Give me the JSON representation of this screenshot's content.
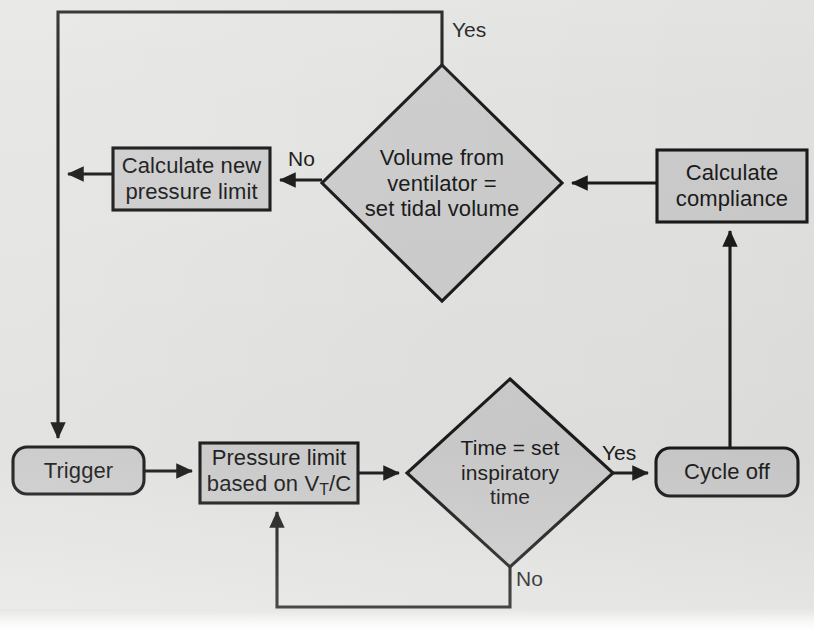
{
  "diagram": {
    "background_color": "#e6e6e4",
    "shape_fill_color": "#cfcfcf",
    "stroke_color": "#1b1b1b"
  },
  "nodes": [
    {
      "id": "trigger",
      "shape": "rounded-rectangle",
      "label": "Trigger",
      "font_size": 22,
      "x": 13,
      "y": 447,
      "w": 131,
      "h": 47,
      "rx": 14
    },
    {
      "id": "pressure-limit",
      "shape": "rectangle",
      "label": "Pressure limit\nbased on V<sub>T</sub>/C",
      "label_plain": "Pressure limit based on VT/C",
      "font_size": 22,
      "x": 200,
      "y": 443,
      "w": 158,
      "h": 60,
      "rx": 0
    },
    {
      "id": "time-check",
      "shape": "diamond",
      "label": "Time = set\ninspiratory\ntime",
      "font_size": 21,
      "cx": 510,
      "cy": 473,
      "w": 206,
      "h": 188
    },
    {
      "id": "cycle-off",
      "shape": "rounded-rectangle",
      "label": "Cycle off",
      "font_size": 22,
      "x": 656,
      "y": 448,
      "w": 142,
      "h": 48,
      "rx": 14
    },
    {
      "id": "calculate-compliance",
      "shape": "rectangle",
      "label": "Calculate\ncompliance",
      "font_size": 22,
      "x": 657,
      "y": 150,
      "w": 150,
      "h": 72,
      "rx": 0
    },
    {
      "id": "volume-check",
      "shape": "diamond",
      "label": "Volume from\nventilator =\nset tidal volume",
      "font_size": 22,
      "cx": 442,
      "cy": 183,
      "w": 240,
      "h": 237
    },
    {
      "id": "calculate-new-pressure-limit",
      "shape": "rectangle",
      "label": "Calculate new\npressure limit",
      "font_size": 22,
      "x": 113,
      "y": 148,
      "w": 157,
      "h": 62,
      "rx": 0
    }
  ],
  "edge_labels": [
    {
      "id": "yes-volume",
      "text": "Yes",
      "x": 452,
      "y": 19
    },
    {
      "id": "no-volume",
      "text": "No",
      "x": 288,
      "y": 148
    },
    {
      "id": "yes-time",
      "text": "Yes",
      "x": 602,
      "y": 442
    },
    {
      "id": "no-time",
      "text": "No",
      "x": 516,
      "y": 568
    }
  ],
  "edges": [
    {
      "id": "trigger-to-pressure-limit",
      "from": "trigger",
      "to": "pressure-limit",
      "label": ""
    },
    {
      "id": "pressure-limit-to-time-check",
      "from": "pressure-limit",
      "to": "time-check",
      "label": ""
    },
    {
      "id": "time-check-yes-to-cycle-off",
      "from": "time-check",
      "to": "cycle-off",
      "label": "Yes"
    },
    {
      "id": "time-check-no-to-pressure-limit",
      "from": "time-check",
      "to": "pressure-limit",
      "label": "No"
    },
    {
      "id": "cycle-off-to-calculate-compliance",
      "from": "cycle-off",
      "to": "calculate-compliance",
      "label": ""
    },
    {
      "id": "calculate-compliance-to-volume-check",
      "from": "calculate-compliance",
      "to": "volume-check",
      "label": ""
    },
    {
      "id": "volume-check-no-to-calculate-new-pressure-limit",
      "from": "volume-check",
      "to": "calculate-new-pressure-limit",
      "label": "No"
    },
    {
      "id": "calculate-new-pressure-limit-to-trigger",
      "from": "calculate-new-pressure-limit",
      "to": "trigger",
      "label": ""
    },
    {
      "id": "volume-check-yes-to-trigger",
      "from": "volume-check",
      "to": "trigger",
      "label": "Yes"
    }
  ]
}
